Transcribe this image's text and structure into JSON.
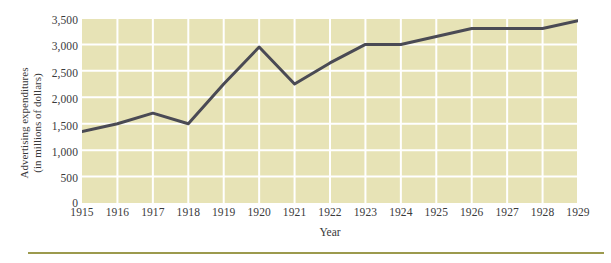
{
  "chart_data": {
    "type": "line",
    "title": "",
    "xlabel": "Year",
    "ylabel": "Advertising expenditures (in millions of dollars)",
    "ylabel_line1": "Advertising expenditures",
    "ylabel_line2": "(in millions of dollars)",
    "categories": [
      "1915",
      "1916",
      "1917",
      "1918",
      "1919",
      "1920",
      "1921",
      "1922",
      "1923",
      "1924",
      "1925",
      "1926",
      "1927",
      "1928",
      "1929"
    ],
    "values": [
      1350,
      1500,
      1700,
      1500,
      2250,
      2950,
      2250,
      2650,
      3000,
      3000,
      3150,
      3300,
      3300,
      3300,
      3450
    ],
    "series": [
      {
        "name": "Advertising expenditures",
        "values": [
          1350,
          1500,
          1700,
          1500,
          2250,
          2950,
          2250,
          2650,
          3000,
          3000,
          3150,
          3300,
          3300,
          3300,
          3450
        ]
      }
    ],
    "ylim": [
      0,
      3500
    ],
    "yticks": [
      0,
      500,
      1000,
      1500,
      2000,
      2500,
      3000,
      3500
    ],
    "ytick_labels": [
      "0",
      "500",
      "1,000",
      "1,500",
      "2,000",
      "2,500",
      "3,000",
      "3,500"
    ],
    "xtick_labels": [
      "1915",
      "1916",
      "1917",
      "1918",
      "1919",
      "1920",
      "1921",
      "1922",
      "1923",
      "1924",
      "1925",
      "1926",
      "1927",
      "1928",
      "1929"
    ],
    "grid": true,
    "grid_color": "#ffffff",
    "legend": false,
    "legend_position": "none",
    "plot_background": "#e7e3b6",
    "line_color": "#4a4a54",
    "rule_color": "#9c9a4e"
  }
}
